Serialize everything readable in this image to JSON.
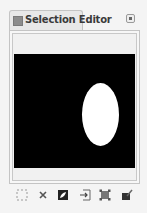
{
  "dock": {
    "tab": {
      "label": "Selection Editor",
      "icon": "selection-editor-icon"
    },
    "menu_button": {
      "icon": "tab-menu-icon"
    }
  },
  "preview": {
    "background": "#000000",
    "selection_shape": "ellipse",
    "selection_color": "#ffffff"
  },
  "toolbar": {
    "buttons": [
      {
        "name": "select-all",
        "icon": "select-all-icon"
      },
      {
        "name": "select-none",
        "icon": "select-none-icon"
      },
      {
        "name": "invert-selection",
        "icon": "invert-selection-icon"
      },
      {
        "name": "save-to-channel",
        "icon": "save-to-channel-icon"
      },
      {
        "name": "to-path",
        "icon": "selection-to-path-icon"
      },
      {
        "name": "stroke-selection",
        "icon": "stroke-selection-icon"
      }
    ]
  }
}
